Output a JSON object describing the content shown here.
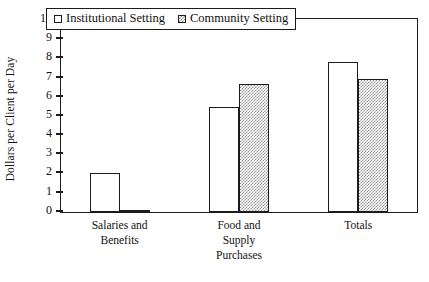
{
  "chart_data": {
    "type": "bar",
    "title": "",
    "xlabel": "",
    "ylabel": "Dollars per Client per Day",
    "ylim": [
      0,
      10
    ],
    "yticks": [
      0,
      1,
      2,
      3,
      4,
      5,
      6,
      7,
      8,
      9,
      10
    ],
    "grid": false,
    "legend_position": "top-center",
    "categories": [
      "Salaries and Benefits",
      "Food and Supply Purchases",
      "Totals"
    ],
    "category_lines": [
      [
        "Salaries and",
        "Benefits"
      ],
      [
        "Food and",
        "Supply",
        "Purchases"
      ],
      [
        "Totals"
      ]
    ],
    "series": [
      {
        "name": "Institutional Setting",
        "values": [
          2.05,
          5.45,
          7.8
        ],
        "fill": "white",
        "swatch": "hollow-square"
      },
      {
        "name": "Community Setting",
        "values": [
          0.05,
          6.65,
          6.95
        ],
        "fill": "checkered-gray",
        "swatch": "checkered-square"
      }
    ]
  },
  "colors": {
    "axis": "#1b1b1b",
    "background": "#ffffff",
    "series_0_fill": "#ffffff",
    "series_1_fill": "#9a9a9a"
  }
}
